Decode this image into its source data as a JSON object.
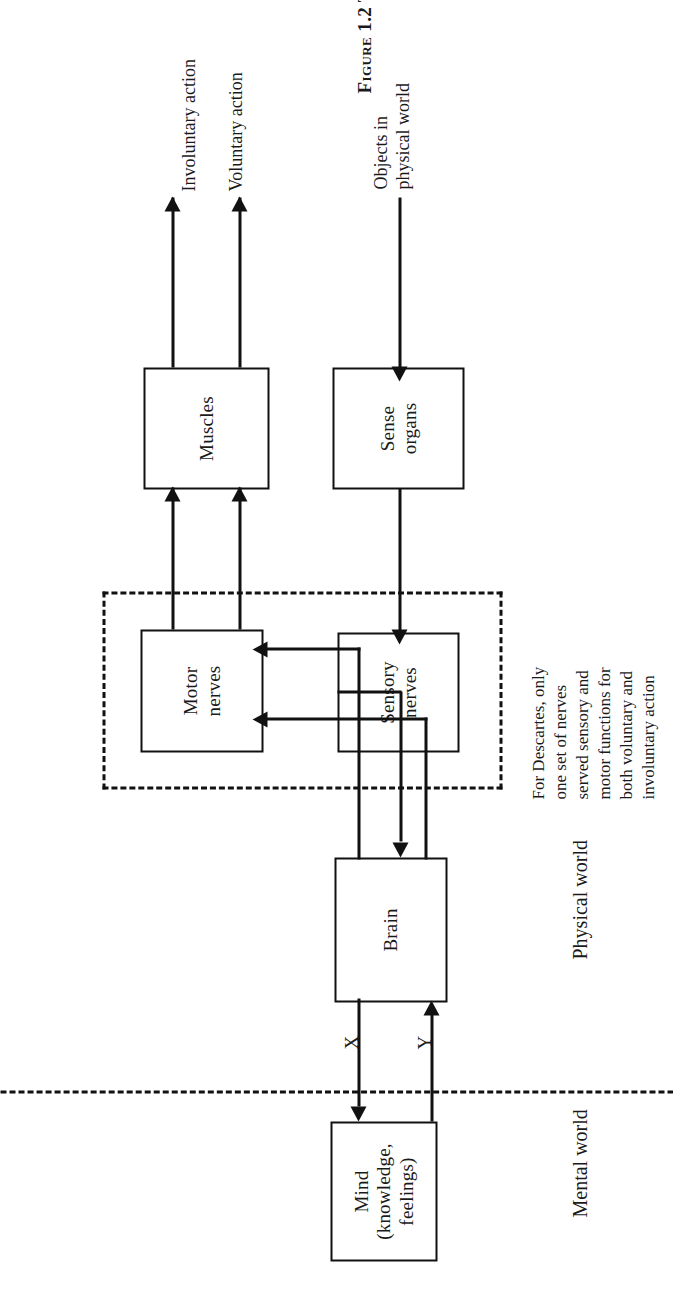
{
  "figure": {
    "caption_number": "Figure 1.2",
    "caption_text": "The dualistic system of Descartes. Objects in the"
  },
  "worlds": {
    "mental_label": "Mental world",
    "physical_label": "Physical world"
  },
  "nodes": {
    "mind": {
      "line1": "Mind",
      "line2": "(knowledge,",
      "line3": "feelings)"
    },
    "brain": {
      "line1": "Brain"
    },
    "sensory_nerves": {
      "line1": "Sensory",
      "line2": "nerves"
    },
    "motor_nerves": {
      "line1": "Motor",
      "line2": "nerves"
    },
    "sense_organs": {
      "line1": "Sense",
      "line2": "organs"
    },
    "muscles": {
      "line1": "Muscles"
    }
  },
  "pathways": {
    "x_label": "X",
    "y_label": "Y"
  },
  "annotations": {
    "descartes_note": {
      "line1": "For Descartes, only",
      "line2": "one set of nerves",
      "line3": "served sensory and",
      "line4": "motor functions for",
      "line5": "both voluntary and",
      "line6": "involuntary action"
    }
  },
  "flow_labels": {
    "objects_line1": "Objects in",
    "objects_line2": "physical world",
    "involuntary": "Involuntary action",
    "voluntary": "Voluntary action"
  },
  "colors": {
    "ink": "#111111",
    "paper": "#ffffff"
  }
}
